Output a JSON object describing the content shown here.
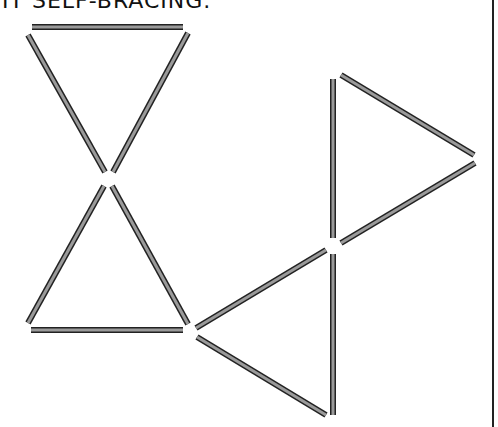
{
  "caption": "IT SELF-BRACING.",
  "colors": {
    "stick_fill": "#9a9a9a",
    "stick_outline": "#222222",
    "border": "#222222"
  },
  "figure": {
    "stick_width": 6,
    "sticks": [
      {
        "x1": 32,
        "y1": 27,
        "x2": 183,
        "y2": 27
      },
      {
        "x1": 28,
        "y1": 35,
        "x2": 105,
        "y2": 172
      },
      {
        "x1": 188,
        "y1": 33,
        "x2": 113,
        "y2": 172
      },
      {
        "x1": 104,
        "y1": 186,
        "x2": 28,
        "y2": 323
      },
      {
        "x1": 112,
        "y1": 186,
        "x2": 188,
        "y2": 324
      },
      {
        "x1": 31,
        "y1": 330,
        "x2": 183,
        "y2": 330
      },
      {
        "x1": 333,
        "y1": 79,
        "x2": 333,
        "y2": 238
      },
      {
        "x1": 341,
        "y1": 75,
        "x2": 474,
        "y2": 155
      },
      {
        "x1": 341,
        "y1": 243,
        "x2": 475,
        "y2": 163
      },
      {
        "x1": 196,
        "y1": 328,
        "x2": 326,
        "y2": 250
      },
      {
        "x1": 197,
        "y1": 337,
        "x2": 326,
        "y2": 415
      },
      {
        "x1": 333,
        "y1": 254,
        "x2": 333,
        "y2": 415
      }
    ]
  }
}
